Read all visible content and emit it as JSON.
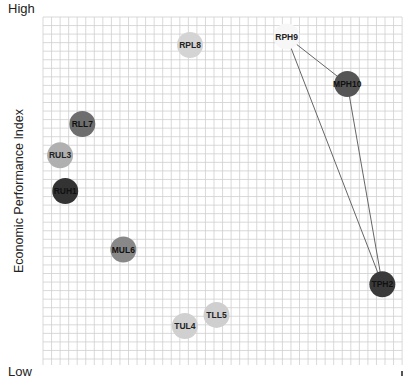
{
  "chart_data": {
    "type": "scatter",
    "title": "",
    "xlabel": "",
    "ylabel": "Economic Performance Index",
    "y_axis_labels": {
      "high": "High",
      "low": "Low"
    },
    "grid": true,
    "xlim": [
      0,
      42
    ],
    "ylim": [
      0,
      41
    ],
    "points": [
      {
        "label": "RPL8",
        "x": 17.2,
        "y": 37.7,
        "color": "#d4d4d4",
        "text_color": "#222222"
      },
      {
        "label": "RPH9",
        "x": 28.5,
        "y": 38.7,
        "color": "#f7f7f7",
        "text_color": "#222222"
      },
      {
        "label": "MPH10",
        "x": 35.6,
        "y": 33.1,
        "color": "#555555",
        "text_color": "#111111"
      },
      {
        "label": "RLL7",
        "x": 4.6,
        "y": 28.4,
        "color": "#6e6e6e",
        "text_color": "#111111"
      },
      {
        "label": "RUL3",
        "x": 2.0,
        "y": 24.7,
        "color": "#b0b0b0",
        "text_color": "#222222"
      },
      {
        "label": "RUH1",
        "x": 2.6,
        "y": 20.5,
        "color": "#333333",
        "text_color": "#111111"
      },
      {
        "label": "MUL6",
        "x": 9.4,
        "y": 13.6,
        "color": "#888888",
        "text_color": "#111111"
      },
      {
        "label": "TPH2",
        "x": 39.7,
        "y": 9.5,
        "color": "#3a3a3a",
        "text_color": "#111111"
      },
      {
        "label": "TLL5",
        "x": 20.3,
        "y": 5.9,
        "color": "#cfcfcf",
        "text_color": "#222222"
      },
      {
        "label": "TUL4",
        "x": 16.6,
        "y": 4.6,
        "color": "#d0d0d0",
        "text_color": "#222222"
      }
    ],
    "connections": [
      [
        "RPH9",
        "MPH10"
      ],
      [
        "MPH10",
        "TPH2"
      ],
      [
        "TPH2",
        "RPH9"
      ]
    ],
    "bubble_radius": 13,
    "line_color": "#666666"
  },
  "labels": {
    "high": "High",
    "low": "Low",
    "ylabel": "Economic Performance Index"
  },
  "plot_area": {
    "left": 43,
    "top": 17,
    "right": 402,
    "bottom": 365,
    "grid_step": 8.55
  }
}
